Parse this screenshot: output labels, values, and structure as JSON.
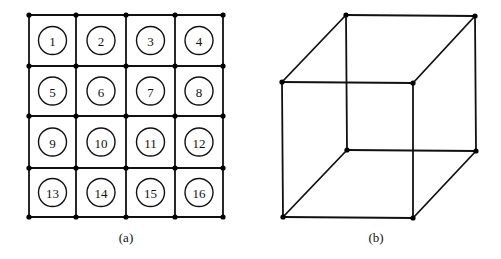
{
  "figure": {
    "panel_a": {
      "caption": "(a)",
      "grid": {
        "rows": 4,
        "cols": 4,
        "x_lines": [
          29,
          76,
          126,
          175,
          223
        ],
        "y_lines": [
          15,
          66,
          116,
          168,
          217
        ]
      },
      "cells": [
        "1",
        "2",
        "3",
        "4",
        "5",
        "6",
        "7",
        "8",
        "9",
        "10",
        "11",
        "12",
        "13",
        "14",
        "15",
        "16"
      ]
    },
    "panel_b": {
      "caption": "(b)",
      "shape": "cube",
      "vertices": {
        "back_top_left": [
          346,
          15
        ],
        "back_top_right": [
          475,
          16
        ],
        "front_top_left": [
          282,
          82
        ],
        "front_top_right": [
          413,
          83
        ],
        "back_bottom_left": [
          347,
          150
        ],
        "back_bottom_right": [
          476,
          151
        ],
        "front_bottom_left": [
          283,
          217
        ],
        "front_bottom_right": [
          413,
          218
        ]
      }
    }
  }
}
